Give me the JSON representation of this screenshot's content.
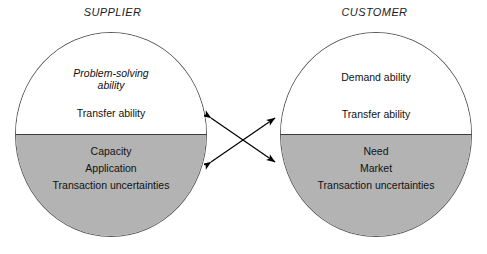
{
  "diagram": {
    "title_visible": false,
    "background_color": "#ffffff",
    "shaded_half_color": "#b3b3b3",
    "unshaded_half_color": "#ffffff",
    "outline_color": "#5a5a5a",
    "text_color": "#111111"
  },
  "supplier": {
    "heading": "SUPPLIER",
    "top_half": {
      "primary": "Problem-solving\nability",
      "primary_style": "italic",
      "secondary": "Transfer ability",
      "secondary_style": "regular"
    },
    "bottom_half": {
      "items": [
        "Capacity",
        "Application",
        "Transaction uncertainties"
      ]
    }
  },
  "customer": {
    "heading": "CUSTOMER",
    "top_half": {
      "primary": "Demand ability",
      "primary_style": "regular",
      "secondary": "Transfer ability",
      "secondary_style": "regular"
    },
    "bottom_half": {
      "items": [
        "Need",
        "Market",
        "Transaction uncertainties"
      ]
    }
  },
  "connector": {
    "name": "crossed-double-arrows",
    "count": 2,
    "arrowheads_per_line": 2,
    "color": "#000000"
  }
}
